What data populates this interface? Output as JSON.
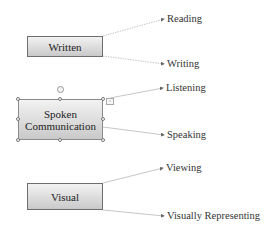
{
  "diagram": {
    "type": "mind-map",
    "nodes": [
      {
        "id": "written",
        "label": "Written",
        "children": [
          "Reading",
          "Writing"
        ]
      },
      {
        "id": "spoken",
        "label_line1": "Spoken",
        "label_line2": "Communication",
        "selected": true,
        "children": [
          "Listening",
          "Speaking"
        ]
      },
      {
        "id": "visual",
        "label": "Visual",
        "children": [
          "Viewing",
          "Visually Representing"
        ]
      }
    ],
    "leaves": {
      "reading": "Reading",
      "writing": "Writing",
      "listening": "Listening",
      "speaking": "Speaking",
      "viewing": "Viewing",
      "visually_representing": "Visually Representing"
    },
    "colors": {
      "connector": "#b5b5b5",
      "box_border": "#6e6e6e",
      "box_fill_top": "#f2f2f2",
      "box_fill_bottom": "#c9c9c9",
      "text": "#222222"
    },
    "smart_tag_glyph": "^"
  }
}
